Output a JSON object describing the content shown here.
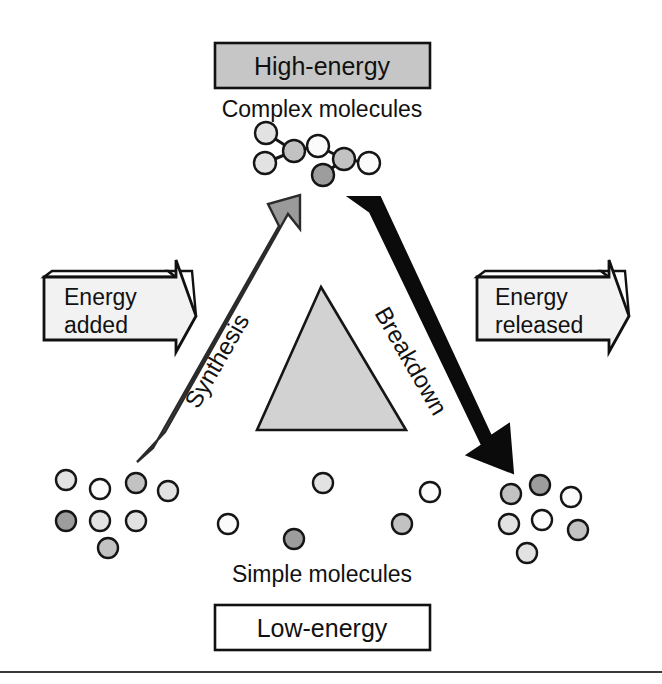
{
  "figure": {
    "title_top_box": "High-energy",
    "subtitle_top": "Complex molecules",
    "subtitle_bottom": "Simple molecules",
    "title_bottom_box": "Low-energy",
    "left_banner": {
      "line1": "Energy",
      "line2": "added"
    },
    "right_banner": {
      "line1": "Energy",
      "line2": "released"
    },
    "left_arrow_label": "Synthesis",
    "right_arrow_label": "Breakdown",
    "icons": {
      "up_arrow": "synthesis-up-arrow-icon",
      "down_arrow": "breakdown-down-arrow-icon",
      "left_banner_arrow": "energy-added-banner-arrow-icon",
      "right_banner_arrow": "energy-released-banner-arrow-icon",
      "center_triangle": "energy-gradient-triangle-icon",
      "complex_molecule": "complex-molecule-chain-icon",
      "simple_molecule": "simple-molecule-circle-icon"
    },
    "colors": {
      "outline": "#111111",
      "high_energy_box_fill": "#c6c6c6",
      "low_energy_box_fill": "#ffffff",
      "banner_fill": "#f2f2f2",
      "synthesis_arrow_fill": "#9a9a9a",
      "breakdown_arrow_fill": "#0b0b0b",
      "triangle_fill": "#d2d2d2",
      "molecule_white": "#fbfbfb",
      "molecule_light": "#e2e2e2",
      "molecule_mid": "#c2c2c2",
      "molecule_dark": "#9d9d9d",
      "rule": "#3a3a3a",
      "page_background": "#ffffff"
    },
    "complex_molecule_nodes": [
      {
        "cx": 266,
        "cy": 133,
        "r": 11,
        "fill": "molecule_light"
      },
      {
        "cx": 294,
        "cy": 151,
        "r": 11,
        "fill": "molecule_mid"
      },
      {
        "cx": 265,
        "cy": 163,
        "r": 11,
        "fill": "molecule_light"
      },
      {
        "cx": 318,
        "cy": 146,
        "r": 11,
        "fill": "molecule_white"
      },
      {
        "cx": 344,
        "cy": 159,
        "r": 11,
        "fill": "molecule_mid"
      },
      {
        "cx": 323,
        "cy": 175,
        "r": 11,
        "fill": "molecule_dark"
      },
      {
        "cx": 369,
        "cy": 163,
        "r": 11,
        "fill": "molecule_white"
      }
    ],
    "complex_molecule_bonds": [
      [
        266,
        133,
        294,
        151
      ],
      [
        294,
        151,
        265,
        163
      ],
      [
        294,
        151,
        318,
        146
      ],
      [
        318,
        146,
        344,
        159
      ],
      [
        344,
        159,
        323,
        175
      ],
      [
        344,
        159,
        369,
        163
      ]
    ],
    "simple_molecules": [
      {
        "cx": 66,
        "cy": 480,
        "r": 10,
        "fill": "molecule_light"
      },
      {
        "cx": 100,
        "cy": 489,
        "r": 10,
        "fill": "molecule_white"
      },
      {
        "cx": 136,
        "cy": 483,
        "r": 10,
        "fill": "molecule_mid"
      },
      {
        "cx": 168,
        "cy": 491,
        "r": 10,
        "fill": "molecule_light"
      },
      {
        "cx": 66,
        "cy": 521,
        "r": 10,
        "fill": "molecule_dark"
      },
      {
        "cx": 100,
        "cy": 521,
        "r": 10,
        "fill": "molecule_light"
      },
      {
        "cx": 136,
        "cy": 521,
        "r": 10,
        "fill": "molecule_light"
      },
      {
        "cx": 108,
        "cy": 548,
        "r": 10,
        "fill": "molecule_mid"
      },
      {
        "cx": 228,
        "cy": 524,
        "r": 10,
        "fill": "molecule_white"
      },
      {
        "cx": 294,
        "cy": 539,
        "r": 10,
        "fill": "molecule_dark"
      },
      {
        "cx": 323,
        "cy": 483,
        "r": 10,
        "fill": "molecule_light"
      },
      {
        "cx": 402,
        "cy": 524,
        "r": 10,
        "fill": "molecule_mid"
      },
      {
        "cx": 430,
        "cy": 492,
        "r": 10,
        "fill": "molecule_white"
      },
      {
        "cx": 511,
        "cy": 494,
        "r": 10,
        "fill": "molecule_mid"
      },
      {
        "cx": 540,
        "cy": 485,
        "r": 10,
        "fill": "molecule_dark"
      },
      {
        "cx": 571,
        "cy": 497,
        "r": 10,
        "fill": "molecule_white"
      },
      {
        "cx": 509,
        "cy": 524,
        "r": 10,
        "fill": "molecule_light"
      },
      {
        "cx": 542,
        "cy": 520,
        "r": 10,
        "fill": "molecule_white"
      },
      {
        "cx": 578,
        "cy": 530,
        "r": 10,
        "fill": "molecule_mid"
      },
      {
        "cx": 527,
        "cy": 553,
        "r": 10,
        "fill": "molecule_light"
      }
    ]
  }
}
